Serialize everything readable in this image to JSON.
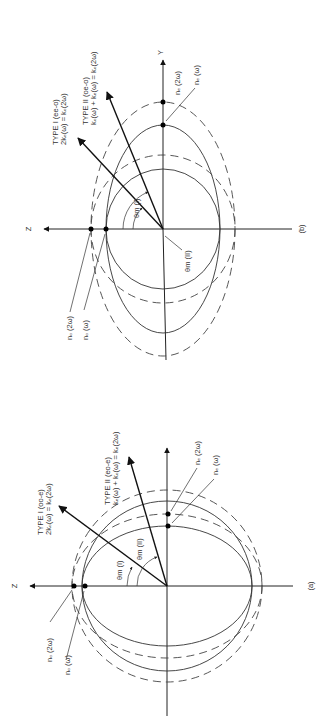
{
  "figure": {
    "orientation": "rotated 90 degrees counter-clockwise",
    "panels": [
      {
        "id": "b",
        "caption": "(b)",
        "axes": {
          "z": "Z",
          "y": "Y"
        },
        "type1": {
          "title": "TYPE I (ee-o)",
          "equation": "2kₑ(ω) = kₒ(2ω)"
        },
        "type2": {
          "title": "TYPE II (oe-o)",
          "equation": "kₒ(ω) + kₑ(ω) = kₒ(2ω)"
        },
        "angles": {
          "theta1": "θm (I)",
          "theta2": "θm (II)"
        },
        "indices": {
          "no2w": "nₒ (2ω)",
          "now": "nₒ (ω)",
          "ne2w": "nₑ (2ω)",
          "new": "nₑ (ω)"
        }
      },
      {
        "id": "a",
        "caption": "(a)",
        "axes": {
          "z": "Z"
        },
        "type1": {
          "title": "TYPE I (oo-e)",
          "equation": "2kₒ(ω) = kₑ(2ω)"
        },
        "type2": {
          "title": "TYPE II (eo-e)",
          "equation": "kₑ(ω) + kₒ(ω) = kₑ(2ω)"
        },
        "angles": {
          "theta1": "θm (I)",
          "theta2": "θm (II)"
        },
        "indices": {
          "no2w": "nₒ (2ω)",
          "now": "nₒ (ω)",
          "ne2w": "nₑ (2ω)",
          "new": "nₑ (ω)"
        }
      }
    ]
  }
}
